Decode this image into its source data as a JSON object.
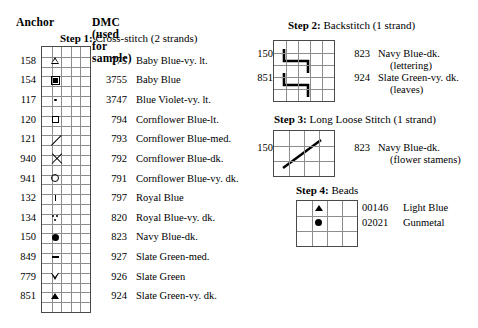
{
  "headers": {
    "anchor": "Anchor",
    "dmc": "DMC (used for sample)"
  },
  "steps": {
    "step1": {
      "label": "Step 1:",
      "title": "Cross-stitch (2 strands)"
    },
    "step2": {
      "label": "Step 2:",
      "title": "Backstitch (1 strand)"
    },
    "step3": {
      "label": "Step 3:",
      "title": "Long Loose Stitch (1 strand)"
    },
    "step4": {
      "label": "Step 4:",
      "title": "Beads"
    }
  },
  "cross_stitch_rows": [
    {
      "anchor": "158",
      "symbol": "triangle-up-open",
      "dmc": "775",
      "name": "Baby Blue-vy. lt."
    },
    {
      "anchor": "154",
      "symbol": "square-filled",
      "dmc": "3755",
      "name": "Baby Blue"
    },
    {
      "anchor": "117",
      "symbol": "dot-small",
      "dmc": "3747",
      "name": "Blue Violet-vy. lt."
    },
    {
      "anchor": "120",
      "symbol": "square-open",
      "dmc": "794",
      "name": "Cornflower Blue-lt."
    },
    {
      "anchor": "121",
      "symbol": "slash",
      "dmc": "793",
      "name": "Cornflower Blue-med."
    },
    {
      "anchor": "940",
      "symbol": "cross-x",
      "dmc": "792",
      "name": "Cornflower Blue-dk."
    },
    {
      "anchor": "941",
      "symbol": "circle-open",
      "dmc": "791",
      "name": "Cornflower Blue-vy. dk."
    },
    {
      "anchor": "132",
      "symbol": "vertical-tick",
      "dmc": "797",
      "name": "Royal Blue"
    },
    {
      "anchor": "134",
      "symbol": "three-dots",
      "dmc": "820",
      "name": "Royal Blue-vy. dk."
    },
    {
      "anchor": "150",
      "symbol": "dot-large",
      "dmc": "823",
      "name": "Navy Blue-dk."
    },
    {
      "anchor": "849",
      "symbol": "horizontal-bar",
      "dmc": "927",
      "name": "Slate Green-med."
    },
    {
      "anchor": "779",
      "symbol": "triangle-down-open",
      "dmc": "926",
      "name": "Slate Green"
    },
    {
      "anchor": "851",
      "symbol": "triangle-up-filled",
      "dmc": "924",
      "name": "Slate Green-vy. dk."
    }
  ],
  "backstitch_rows": [
    {
      "anchor": "150",
      "dmc": "823",
      "name": "Navy Blue-dk.",
      "note": "(lettering)"
    },
    {
      "anchor": "851",
      "dmc": "924",
      "name": "Slate Green-vy. dk.",
      "note": "(leaves)"
    }
  ],
  "long_stitch_rows": [
    {
      "anchor": "150",
      "dmc": "823",
      "name": "Navy Blue-dk.",
      "note": "(flower stamens)"
    }
  ],
  "bead_rows": [
    {
      "code": "00146",
      "name": "Light Blue",
      "symbol": "triangle-up-filled"
    },
    {
      "code": "02021",
      "name": "Gunmetal",
      "symbol": "dot-large"
    }
  ],
  "colors": {
    "ink": "#000000",
    "grid_line": "#8d8d8d",
    "grid_border": "#4a4a4a",
    "background": "#ffffff"
  }
}
